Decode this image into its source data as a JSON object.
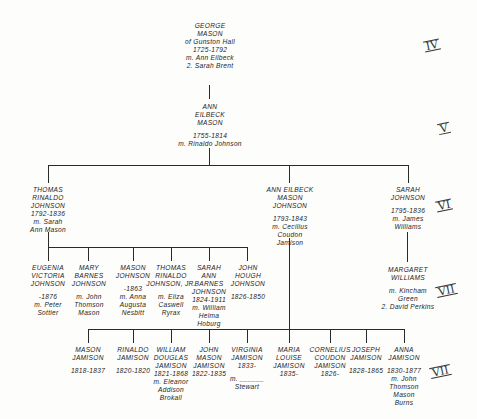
{
  "generations": [
    "IV",
    "V",
    "VI",
    "VII",
    "VIII"
  ],
  "people": {
    "george": {
      "name": [
        "George",
        "Mason"
      ],
      "extra": [
        "of Gunston Hall"
      ],
      "dates": "1725-1792",
      "spouse": [
        "m. Ann Eilbeck",
        "2. Sarah Brent"
      ]
    },
    "ann_eilbeck": {
      "name": [
        "Ann",
        "Eilbeck",
        "Mason"
      ],
      "dates": "1755-1814",
      "spouse": [
        "m. Rinaldo Johnson"
      ]
    },
    "thomas_rinaldo": {
      "name": [
        "Thomas",
        "Rinaldo",
        "Johnson"
      ],
      "dates": "1792-1836",
      "spouse": [
        "m. Sarah",
        "Ann Mason"
      ]
    },
    "ann_eilbeck_jamison": {
      "name": [
        "Ann Eilbeck",
        "Mason",
        "Johnson"
      ],
      "dates": "1793-1843",
      "spouse": [
        "m. Cecilius",
        "Coudon",
        "Jamison"
      ]
    },
    "sarah_johnson": {
      "name": [
        "Sarah",
        "Johnson"
      ],
      "dates": "1795-1836",
      "spouse": [
        "m. James",
        "Williams"
      ]
    },
    "eugenia": {
      "name": [
        "Eugenia",
        "Victoria",
        "Johnson"
      ],
      "dates": "-1876",
      "spouse": [
        "m. Peter",
        "Sottier"
      ]
    },
    "mary": {
      "name": [
        "Mary",
        "Barnes",
        "Johnson"
      ],
      "dates": "",
      "spouse": [
        "m. John",
        "Thomson",
        "Mason"
      ]
    },
    "mason_j": {
      "name": [
        "Mason",
        "Johnson"
      ],
      "dates": "-1863",
      "spouse": [
        "m. Anna",
        "Augusta",
        "Nesbitt"
      ]
    },
    "thomas_jr": {
      "name": [
        "Thomas",
        "Rinaldo",
        "Johnson, Jr."
      ],
      "dates": "",
      "spouse": [
        "m. Eliza",
        "Caswell",
        "Ryrax"
      ]
    },
    "sarah_ann": {
      "name": [
        "Sarah",
        "Ann",
        "Barnes",
        "Johnson"
      ],
      "dates": "1824-1911",
      "spouse": [
        "m. William",
        "Helma",
        "Hoburg"
      ]
    },
    "john_hough": {
      "name": [
        "John",
        "Hough",
        "Johnson"
      ],
      "dates": "1826-1850",
      "spouse": []
    },
    "margaret": {
      "name": [
        "Margaret",
        "Williams"
      ],
      "dates": "",
      "spouse": [
        "m. Kincham",
        "Green",
        "2. David Perkins"
      ]
    },
    "mason_jam": {
      "name": [
        "Mason",
        "Jamison"
      ],
      "dates": "1818-1837",
      "spouse": []
    },
    "rinaldo_jam": {
      "name": [
        "Rinaldo",
        "Jamison"
      ],
      "dates": "1820-1820",
      "spouse": []
    },
    "william_jam": {
      "name": [
        "William",
        "Douglas",
        "Jamison"
      ],
      "dates": "1821-1868",
      "spouse": [
        "m. Eleanor",
        "Addison",
        "Brokall"
      ]
    },
    "john_mason_jam": {
      "name": [
        "John",
        "Mason",
        "Jamison"
      ],
      "dates": "1822-1835",
      "spouse": []
    },
    "virginia_jam": {
      "name": [
        "Virginia",
        "Jamison"
      ],
      "dates": "1833-",
      "spouse": [
        "m. ______",
        "Stewart"
      ]
    },
    "maria_jam": {
      "name": [
        "Maria",
        "Louise",
        "Jamison"
      ],
      "dates": "1835-",
      "spouse": []
    },
    "cornelius_jam": {
      "name": [
        "Cornelius",
        "Coudon",
        "Jamison"
      ],
      "dates": "1826-",
      "spouse": []
    },
    "joseph_jam": {
      "name": [
        "Joseph",
        "Jamison"
      ],
      "dates": "1828-1865",
      "spouse": []
    },
    "anna_jam": {
      "name": [
        "Anna",
        "Jamison"
      ],
      "dates": "1830-1877",
      "spouse": [
        "m. John",
        "Thomson",
        "Mason",
        "Burns"
      ]
    }
  }
}
